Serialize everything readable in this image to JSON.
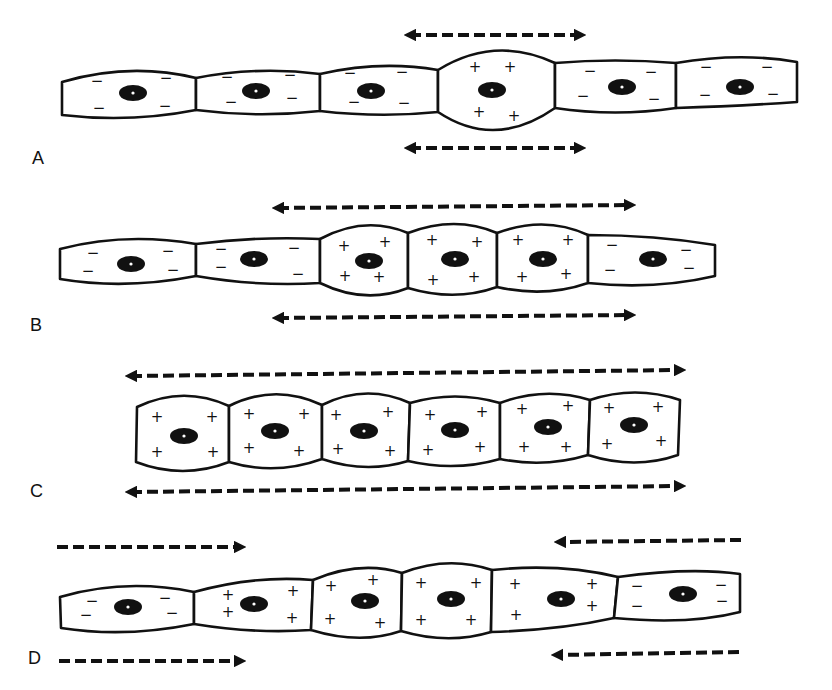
{
  "figure": {
    "type": "bioelectric coupling diagram of epithelial cell chain",
    "panels": [
      {
        "label": "A",
        "cells": [
          {
            "x": [
              62,
              196
            ],
            "charge": "-"
          },
          {
            "x": [
              196,
              320
            ],
            "charge": "-"
          },
          {
            "x": [
              320,
              438
            ],
            "charge": "-"
          },
          {
            "x": [
              438,
              555
            ],
            "charge": "+",
            "bulge": true
          },
          {
            "x": [
              555,
              676
            ],
            "charge": "-"
          },
          {
            "x": [
              676,
              798
            ],
            "charge": "-"
          }
        ],
        "arrows": [
          {
            "y": 35,
            "x1": 405,
            "x2": 585,
            "dir": "both"
          },
          {
            "y": 148,
            "x1": 405,
            "x2": 585,
            "dir": "both"
          }
        ]
      },
      {
        "label": "B",
        "cells": [
          {
            "x": [
              60,
              196
            ],
            "charge": "-"
          },
          {
            "x": [
              196,
              320
            ],
            "charge": "-"
          },
          {
            "x": [
              320,
              408
            ],
            "charge": "+",
            "bulge": true
          },
          {
            "x": [
              408,
              497
            ],
            "charge": "+",
            "bulge": true
          },
          {
            "x": [
              497,
              588
            ],
            "charge": "+",
            "bulge": true
          },
          {
            "x": [
              588,
              715
            ],
            "charge": "-"
          }
        ],
        "arrows": [
          {
            "y": 208,
            "x1": 272,
            "x2": 635,
            "dir": "both"
          },
          {
            "y": 318,
            "x1": 272,
            "x2": 635,
            "dir": "both"
          }
        ]
      },
      {
        "label": "C",
        "cells": [
          {
            "x": [
              136,
              229
            ],
            "charge": "+",
            "bulge": true
          },
          {
            "x": [
              229,
              322
            ],
            "charge": "+",
            "bulge": true
          },
          {
            "x": [
              322,
              410
            ],
            "charge": "+",
            "bulge": true
          },
          {
            "x": [
              410,
              500
            ],
            "charge": "+",
            "bulge": true
          },
          {
            "x": [
              500,
              590
            ],
            "charge": "+",
            "bulge": true
          },
          {
            "x": [
              590,
              680
            ],
            "charge": "+",
            "bulge": true
          }
        ],
        "arrows": [
          {
            "y": 376,
            "x1": 125,
            "x2": 685,
            "dir": "both"
          },
          {
            "y": 492,
            "x1": 125,
            "x2": 685,
            "dir": "both"
          }
        ]
      },
      {
        "label": "D",
        "cells": [
          {
            "x": [
              60,
              195
            ],
            "charge": "-"
          },
          {
            "x": [
              195,
              312
            ],
            "charge": "+"
          },
          {
            "x": [
              312,
              402
            ],
            "charge": "+",
            "bulge": true
          },
          {
            "x": [
              402,
              492
            ],
            "charge": "+",
            "bulge": true
          },
          {
            "x": [
              492,
              614
            ],
            "charge": "+"
          },
          {
            "x": [
              614,
              742
            ],
            "charge": "-"
          }
        ],
        "arrows": [
          {
            "y": 547,
            "x1": 55,
            "x2": 245,
            "dir": "right"
          },
          {
            "y": 661,
            "x1": 58,
            "x2": 245,
            "dir": "right"
          },
          {
            "y": 540,
            "x1": 555,
            "x2": 742,
            "dir": "left"
          },
          {
            "y": 654,
            "x1": 552,
            "x2": 740,
            "dir": "left"
          }
        ]
      }
    ]
  },
  "labels": {
    "A": "A",
    "B": "B",
    "C": "C",
    "D": "D"
  },
  "symbols": {
    "positive": "+",
    "negative": "−"
  },
  "colors": {
    "ink": "#111111",
    "background": "#ffffff"
  }
}
